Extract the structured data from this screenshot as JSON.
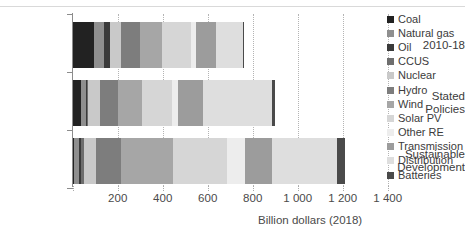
{
  "chart_data": {
    "type": "bar",
    "orientation": "horizontal",
    "stacked": true,
    "title": "",
    "xlabel": "Billion dollars (2018)",
    "ylabel": "",
    "xlim": [
      0,
      1400
    ],
    "xticks": [
      0,
      200,
      400,
      600,
      800,
      1000,
      1200,
      1400
    ],
    "xtick_labels": [
      "",
      "200",
      "400",
      "600",
      "800",
      "1 000",
      "1 200",
      "1 400"
    ],
    "grid": "vertical-dotted",
    "legend_position": "right",
    "categories": [
      "2010-18",
      "Stated Policies",
      "Sustainable Development"
    ],
    "category_labels": [
      [
        "2010-18"
      ],
      [
        "Stated",
        "Policies"
      ],
      [
        "Sustainable",
        "Development"
      ]
    ],
    "series": [
      {
        "name": "Coal",
        "color": "#222222",
        "values": [
          95,
          35,
          5
        ]
      },
      {
        "name": "Natural gas",
        "color": "#8f8f8f",
        "values": [
          45,
          25,
          25
        ]
      },
      {
        "name": "Oil",
        "color": "#3a3a3a",
        "values": [
          25,
          5,
          5
        ]
      },
      {
        "name": "CCUS",
        "color": "#6e6e6e",
        "values": [
          3,
          3,
          15
        ]
      },
      {
        "name": "Nuclear",
        "color": "#c9c9c9",
        "values": [
          45,
          55,
          55
        ]
      },
      {
        "name": "Hydro",
        "color": "#7d7d7d",
        "values": [
          85,
          80,
          110
        ]
      },
      {
        "name": "Wind",
        "color": "#a6a6a6",
        "values": [
          100,
          105,
          230
        ]
      },
      {
        "name": "Solar PV",
        "color": "#d6d6d6",
        "values": [
          130,
          135,
          240
        ]
      },
      {
        "name": "Other RE",
        "color": "#ededed",
        "values": [
          20,
          25,
          80
        ]
      },
      {
        "name": "Transmission",
        "color": "#9c9c9c",
        "values": [
          90,
          110,
          120
        ]
      },
      {
        "name": "Distribution",
        "color": "#dedede",
        "values": [
          120,
          310,
          290
        ]
      },
      {
        "name": "Batteries",
        "color": "#4a4a4a",
        "values": [
          2,
          10,
          35
        ]
      }
    ],
    "totals": [
      760,
      898,
      1210
    ]
  },
  "legend": {
    "items": [
      {
        "label": "Coal"
      },
      {
        "label": "Natural gas"
      },
      {
        "label": "Oil"
      },
      {
        "label": "CCUS"
      },
      {
        "label": "Nuclear"
      },
      {
        "label": "Hydro"
      },
      {
        "label": "Wind"
      },
      {
        "label": "Solar PV"
      },
      {
        "label": "Other RE"
      },
      {
        "label": "Transmission"
      },
      {
        "label": "Distribution"
      },
      {
        "label": "Batteries"
      }
    ]
  }
}
